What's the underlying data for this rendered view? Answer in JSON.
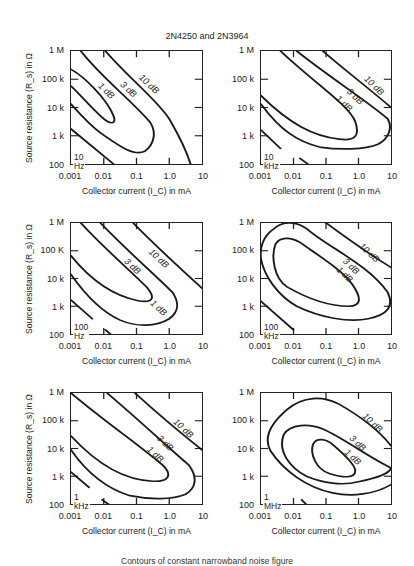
{
  "title": "2N4250 and 2N3964",
  "caption": "Contours of constant narrowband noise figure",
  "axes": {
    "xlabel": "Collector current (I_C) in mA",
    "ylabel": "Source resistance (R_s) in Ω",
    "xticks": [
      "0.001",
      "0.01",
      "0.1",
      "1.0",
      "10"
    ],
    "yticks": [
      "1 M",
      "100 k",
      "10 k",
      "1 k",
      "100"
    ],
    "yticks_alt": [
      "1 M",
      "100 K",
      "10 k",
      "1 k",
      "100"
    ]
  },
  "panels": [
    {
      "frequency": "10 Hz"
    },
    {
      "frequency": "10 kHz"
    },
    {
      "frequency": "100 Hz"
    },
    {
      "frequency": "100 kHz"
    },
    {
      "frequency": "1 kHz"
    },
    {
      "frequency": "1 MHz"
    }
  ],
  "chart_data": [
    {
      "type": "line",
      "title": "10 Hz",
      "xlabel": "Collector current (I_C) in mA",
      "ylabel": "Source resistance (R_s) in Ω",
      "xscale": "log",
      "yscale": "log",
      "xlim": [
        0.001,
        10
      ],
      "ylim": [
        100,
        1000000
      ],
      "series": [
        {
          "name": "1 dB",
          "shape": "closed contour (open to left)",
          "points": [
            [
              0.001,
              200000
            ],
            [
              0.005,
              60000
            ],
            [
              0.02,
              4000
            ],
            [
              0.02,
              3000
            ],
            [
              0.005,
              10000
            ],
            [
              0.001,
              50000
            ]
          ]
        },
        {
          "name": "3 dB",
          "points": [
            [
              0.002,
              1000000
            ],
            [
              0.05,
              50000
            ],
            [
              0.35,
              2000
            ],
            [
              0.15,
              250
            ],
            [
              0.02,
              1000
            ],
            [
              0.001,
              13000
            ]
          ]
        },
        {
          "name": "10 dB",
          "points": [
            [
              0.011,
              1000000
            ],
            [
              0.3,
              50000
            ],
            [
              2,
              1500
            ],
            [
              5.5,
              100
            ]
          ]
        },
        {
          "name": "noise limit line",
          "points": [
            [
              0.001,
              1700
            ],
            [
              0.02,
              100
            ]
          ]
        }
      ]
    },
    {
      "type": "line",
      "title": "10 kHz",
      "xlabel": "Collector current (I_C) in mA",
      "ylabel": "Source resistance (R_s) in Ω",
      "xscale": "log",
      "yscale": "log",
      "xlim": [
        0.001,
        10
      ],
      "ylim": [
        100,
        1000000
      ],
      "series": [
        {
          "name": "1 dB",
          "points": [
            [
              0.004,
              1000000
            ],
            [
              0.1,
              60000
            ],
            [
              0.9,
              2500
            ],
            [
              0.6,
              500
            ],
            [
              0.02,
              1500
            ],
            [
              0.001,
              40000
            ]
          ]
        },
        {
          "name": "3 dB",
          "points": [
            [
              0.013,
              1000000
            ],
            [
              1,
              40000
            ],
            [
              10,
              1500
            ],
            [
              8,
              500
            ],
            [
              0.7,
              160
            ],
            [
              0.05,
              300
            ],
            [
              0.001,
              10000
            ]
          ]
        },
        {
          "name": "10 dB",
          "points": [
            [
              0.07,
              1000000
            ],
            [
              2,
              80000
            ],
            [
              10,
              15000
            ]
          ]
        },
        {
          "name": "noise limit line",
          "points": [
            [
              0.001,
              1800
            ],
            [
              0.005,
              500
            ]
          ]
        },
        {
          "name": "noise limit line (lower)",
          "points": [
            [
              0.02,
              110
            ],
            [
              0.03,
              90
            ]
          ]
        }
      ]
    },
    {
      "type": "line",
      "title": "100 Hz",
      "xlabel": "Collector current (I_C) in mA",
      "ylabel": "Source resistance (R_s) in Ω",
      "xscale": "log",
      "yscale": "log",
      "xlim": [
        0.001,
        10
      ],
      "ylim": [
        100,
        1000000
      ],
      "series": [
        {
          "name": "1 dB",
          "points": [
            [
              0.002,
              1000000
            ],
            [
              0.05,
              40000
            ],
            [
              0.3,
              2000
            ],
            [
              0.15,
              1200
            ],
            [
              0.02,
              3000
            ],
            [
              0.001,
              60000
            ]
          ]
        },
        {
          "name": "3 dB",
          "points": [
            [
              0.01,
              1000000
            ],
            [
              0.5,
              30000
            ],
            [
              2,
              1000
            ],
            [
              1,
              200
            ],
            [
              0.3,
              150
            ],
            [
              0.02,
              1000
            ],
            [
              0.001,
              10000
            ]
          ]
        },
        {
          "name": "10 dB",
          "points": [
            [
              0.1,
              1000000
            ],
            [
              2,
              40000
            ],
            [
              10,
              1500
            ]
          ]
        },
        {
          "name": "noise limit line",
          "points": [
            [
              0.001,
              1700
            ],
            [
              0.005,
              300
            ]
          ]
        },
        {
          "name": "noise limit line (lower)",
          "points": [
            [
              0.01,
              110
            ],
            [
              0.02,
              90
            ]
          ]
        }
      ]
    },
    {
      "type": "line",
      "title": "100 kHz",
      "xlabel": "Collector current (I_C) in mA",
      "ylabel": "Source resistance (R_s) in Ω",
      "xscale": "log",
      "yscale": "log",
      "xlim": [
        0.001,
        10
      ],
      "ylim": [
        100,
        1000000
      ],
      "series": [
        {
          "name": "1 dB",
          "shape": "closed contour",
          "points": [
            [
              0.005,
              200000
            ],
            [
              0.01,
              150000
            ],
            [
              0.2,
              40000
            ],
            [
              1,
              3000
            ],
            [
              0.9,
              800
            ],
            [
              0.2,
              1000
            ],
            [
              0.004,
              10000
            ],
            [
              0.003,
              50000
            ]
          ]
        },
        {
          "name": "3 dB",
          "shape": "closed contour",
          "points": [
            [
              0.003,
              800000
            ],
            [
              0.01,
              1000000
            ],
            [
              0.5,
              100000
            ],
            [
              10,
              2000
            ],
            [
              10,
              700
            ],
            [
              2,
              200
            ],
            [
              0.3,
              200
            ],
            [
              0.003,
              10000
            ],
            [
              0.001,
              100000
            ]
          ]
        },
        {
          "name": "10 dB",
          "points": [
            [
              0.1,
              1000000
            ],
            [
              2,
              80000
            ],
            [
              10,
              25000
            ]
          ]
        },
        {
          "name": "noise limit line",
          "points": [
            [
              0.001,
              1800
            ],
            [
              0.006,
              250
            ]
          ]
        }
      ]
    },
    {
      "type": "line",
      "title": "1 kHz",
      "xlabel": "Collector current (I_C) in mA",
      "ylabel": "Source resistance (R_s) in Ω",
      "xscale": "log",
      "yscale": "log",
      "xlim": [
        0.001,
        10
      ],
      "ylim": [
        100,
        1000000
      ],
      "series": [
        {
          "name": "1 dB",
          "points": [
            [
              0.001,
              1000000
            ],
            [
              0.1,
              30000
            ],
            [
              1,
              1500
            ],
            [
              0.6,
              700
            ],
            [
              0.02,
              3000
            ],
            [
              0.001,
              40000
            ]
          ]
        },
        {
          "name": "3 dB",
          "points": [
            [
              0.015,
              1000000
            ],
            [
              1,
              40000
            ],
            [
              7,
              1200
            ],
            [
              5,
              300
            ],
            [
              1,
              130
            ],
            [
              0.1,
              300
            ],
            [
              0.001,
              10000
            ]
          ]
        },
        {
          "name": "10 dB",
          "points": [
            [
              0.1,
              1000000
            ],
            [
              2,
              60000
            ],
            [
              10,
              10000
            ]
          ]
        },
        {
          "name": "noise limit line",
          "points": [
            [
              0.001,
              1700
            ],
            [
              0.004,
              400
            ]
          ]
        },
        {
          "name": "noise limit line (lower)",
          "points": [
            [
              0.01,
              100
            ],
            [
              0.015,
              90
            ]
          ]
        }
      ]
    },
    {
      "type": "line",
      "title": "1 MHz",
      "xlabel": "Collector current (I_C) in mA",
      "ylabel": "Source resistance (R_s) in Ω",
      "xscale": "log",
      "yscale": "log",
      "xlim": [
        0.001,
        10
      ],
      "ylim": [
        100,
        1000000
      ],
      "series": [
        {
          "name": "1 dB",
          "shape": "closed contour",
          "points": [
            [
              0.07,
              30000
            ],
            [
              0.1,
              25000
            ],
            [
              0.5,
              4000
            ],
            [
              1,
              1000
            ],
            [
              0.3,
              500
            ],
            [
              0.07,
              3000
            ],
            [
              0.05,
              10000
            ]
          ]
        },
        {
          "name": "3 dB",
          "shape": "closed contour",
          "points": [
            [
              0.05,
              100000
            ],
            [
              0.3,
              80000
            ],
            [
              2,
              10000
            ],
            [
              10,
              1500
            ],
            [
              5,
              600
            ],
            [
              0.5,
              200
            ],
            [
              0.05,
              800
            ],
            [
              0.007,
              10000
            ],
            [
              0.01,
              50000
            ]
          ]
        },
        {
          "name": "10 dB",
          "shape": "closed contour (open to bottom-right)",
          "points": [
            [
              0.08,
              700000
            ],
            [
              0.3,
              600000
            ],
            [
              2,
              150000
            ],
            [
              10,
              25000
            ],
            [
              10,
              200
            ],
            [
              1,
              100
            ],
            [
              0.1,
              200
            ],
            [
              0.01,
              3000
            ],
            [
              0.002,
              10000
            ],
            [
              0.005,
              200000
            ],
            [
              0.05,
              700000
            ]
          ]
        },
        {
          "name": "noise limit line",
          "points": [
            [
              0.01,
              130
            ],
            [
              0.04,
              60
            ]
          ]
        }
      ]
    }
  ]
}
